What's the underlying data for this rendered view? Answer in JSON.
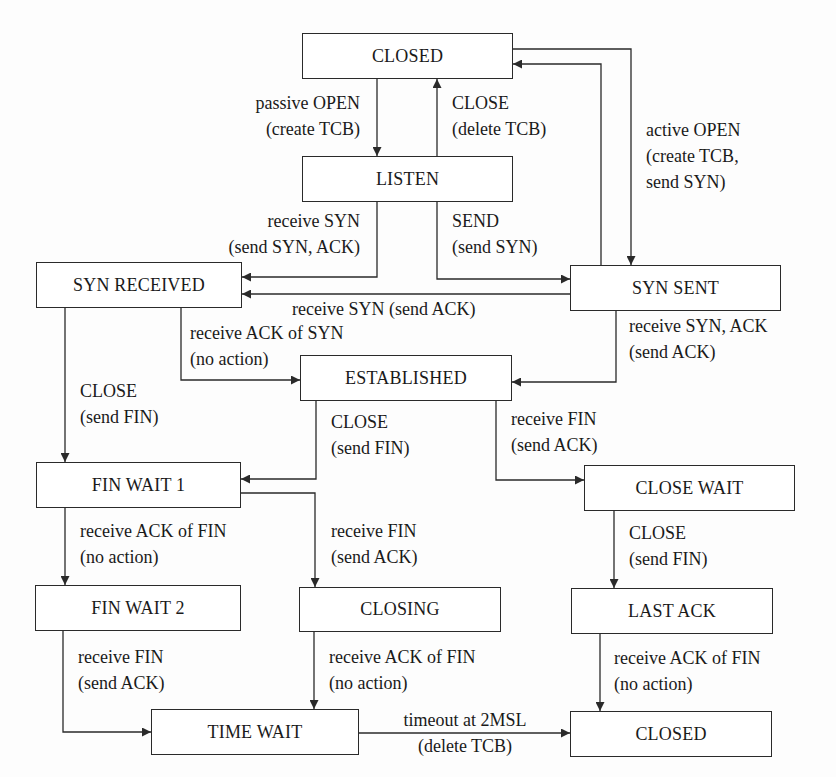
{
  "diagram": {
    "type": "state-machine",
    "states": {
      "closed_top": "CLOSED",
      "listen": "LISTEN",
      "syn_received": "SYN RECEIVED",
      "syn_sent": "SYN SENT",
      "established": "ESTABLISHED",
      "fin_wait_1": "FIN WAIT 1",
      "close_wait": "CLOSE WAIT",
      "fin_wait_2": "FIN WAIT 2",
      "closing": "CLOSING",
      "last_ack": "LAST ACK",
      "time_wait": "TIME WAIT",
      "closed_bottom": "CLOSED"
    },
    "transitions": {
      "passive_open": {
        "from": "CLOSED",
        "to": "LISTEN",
        "event": "passive OPEN",
        "action": "(create TCB)"
      },
      "listen_close": {
        "from": "LISTEN",
        "to": "CLOSED",
        "event": "CLOSE",
        "action": "(delete TCB)"
      },
      "active_open": {
        "from": "CLOSED",
        "to": "SYN SENT",
        "event": "active OPEN",
        "action_line1": "(create TCB,",
        "action_line2": "send SYN)"
      },
      "syn_sent_close": {
        "from": "SYN SENT",
        "to": "CLOSED"
      },
      "listen_rcv_syn": {
        "from": "LISTEN",
        "to": "SYN RECEIVED",
        "event": "receive SYN",
        "action": "(send SYN, ACK)"
      },
      "listen_send": {
        "from": "LISTEN",
        "to": "SYN SENT",
        "event": "SEND",
        "action": "(send SYN)"
      },
      "simultaneous_open": {
        "from": "SYN SENT",
        "to": "SYN RECEIVED",
        "label": "receive SYN (send ACK)"
      },
      "rcv_ack_of_syn": {
        "from": "SYN RECEIVED",
        "to": "ESTABLISHED",
        "event": "receive ACK of SYN",
        "action": "(no action)"
      },
      "rcv_syn_ack": {
        "from": "SYN SENT",
        "to": "ESTABLISHED",
        "event": "receive SYN, ACK",
        "action": "(send ACK)"
      },
      "syn_rcvd_close": {
        "from": "SYN RECEIVED",
        "to": "FIN WAIT 1",
        "event": "CLOSE",
        "action": "(send FIN)"
      },
      "est_close": {
        "from": "ESTABLISHED",
        "to": "FIN WAIT 1",
        "event": "CLOSE",
        "action": "(send FIN)"
      },
      "est_rcv_fin": {
        "from": "ESTABLISHED",
        "to": "CLOSE WAIT",
        "event": "receive FIN",
        "action": "(send ACK)"
      },
      "fw1_rcv_ack": {
        "from": "FIN WAIT 1",
        "to": "FIN WAIT 2",
        "event": "receive ACK of FIN",
        "action": "(no action)"
      },
      "fw1_rcv_fin": {
        "from": "FIN WAIT 1",
        "to": "CLOSING",
        "event": "receive FIN",
        "action": "(send ACK)"
      },
      "cw_close": {
        "from": "CLOSE WAIT",
        "to": "LAST ACK",
        "event": "CLOSE",
        "action": "(send FIN)"
      },
      "fw2_rcv_fin": {
        "from": "FIN WAIT 2",
        "to": "TIME WAIT",
        "event": "receive FIN",
        "action": "(send ACK)"
      },
      "closing_rcv_ack": {
        "from": "CLOSING",
        "to": "TIME WAIT",
        "event": "receive ACK of FIN",
        "action": "(no action)"
      },
      "last_ack_rcv_ack": {
        "from": "LAST ACK",
        "to": "CLOSED",
        "event": "receive ACK of FIN",
        "action": "(no action)"
      },
      "timeout": {
        "from": "TIME WAIT",
        "to": "CLOSED",
        "event": "timeout at 2MSL",
        "action": "(delete TCB)"
      }
    },
    "colors": {
      "line": "#2a2a2a",
      "text": "#1a1a1a",
      "background": "#fdfdfd"
    }
  }
}
